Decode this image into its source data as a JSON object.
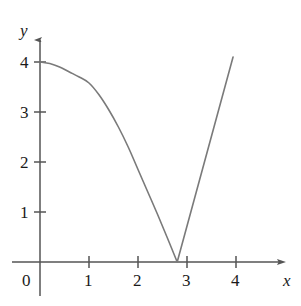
{
  "chart_data": {
    "type": "line",
    "title": "",
    "subtitle": "",
    "xlabel": "x",
    "ylabel": "y",
    "xlim": [
      0,
      4.4
    ],
    "ylim": [
      0,
      4.4
    ],
    "grid": false,
    "legend": null,
    "annotations": [],
    "axis": {
      "x_ticks": [
        1,
        2,
        3,
        4
      ],
      "x_tick_labels": [
        "1",
        "2",
        "3",
        "4"
      ],
      "y_ticks": [
        1,
        2,
        3,
        4
      ],
      "y_tick_labels": [
        "1",
        "2",
        "3",
        "4"
      ],
      "origin_label": "0",
      "x_arrow": true,
      "y_arrow": true,
      "color": "#555555"
    },
    "series": [
      {
        "name": "curve",
        "color": "#7a7a7a",
        "width": 1.6,
        "vertex": {
          "x": 2.8,
          "y": 0
        },
        "x": [
          0.0,
          0.2,
          0.4,
          0.6,
          0.8,
          1.0,
          1.2,
          1.4,
          1.6,
          1.8,
          2.0,
          2.2,
          2.4,
          2.6,
          2.8,
          3.0,
          3.2,
          3.4,
          3.6,
          3.8,
          3.94
        ],
        "y": [
          4.0,
          3.97,
          3.9,
          3.8,
          3.7,
          3.58,
          3.35,
          3.05,
          2.7,
          2.3,
          1.85,
          1.4,
          0.95,
          0.48,
          0.0,
          0.72,
          1.44,
          2.16,
          2.88,
          3.6,
          4.1
        ]
      }
    ]
  },
  "labels": {
    "y_axis_name": "y",
    "x_axis_name": "x",
    "zero": "0",
    "y1": "1",
    "y2": "2",
    "y3": "3",
    "y4": "4",
    "x1": "1",
    "x2": "2",
    "x3": "3",
    "x4": "4"
  }
}
